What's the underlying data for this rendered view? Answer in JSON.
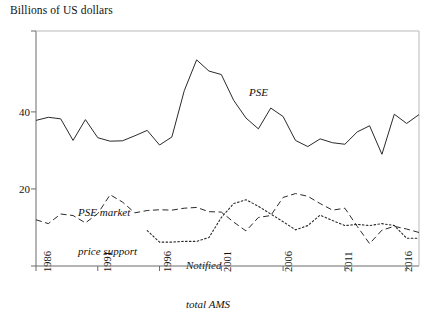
{
  "chart_data": {
    "type": "line",
    "title": "Billions of US dollars",
    "xlabel": "",
    "ylabel": "Billions of US dollars",
    "ylim": [
      0,
      61
    ],
    "xlim": [
      1986,
      2017
    ],
    "grid": false,
    "legend_position": "inline-annotations",
    "yticks": [
      20,
      40
    ],
    "ytick_labels": [
      "20",
      "40"
    ],
    "xticks": [
      1986,
      1991,
      1996,
      2001,
      2006,
      2011,
      2016
    ],
    "xtick_labels": [
      "1986",
      "1991",
      "1996",
      "2001",
      "2006",
      "2011",
      "2016"
    ],
    "x": [
      1986,
      1987,
      1988,
      1989,
      1990,
      1991,
      1992,
      1993,
      1994,
      1995,
      1996,
      1997,
      1998,
      1999,
      2000,
      2001,
      2002,
      2003,
      2004,
      2005,
      2006,
      2007,
      2008,
      2009,
      2010,
      2011,
      2012,
      2013,
      2014,
      2015,
      2016,
      2017
    ],
    "series": [
      {
        "name": "PSE",
        "style": "solid",
        "label": "PSE",
        "values": [
          37.8,
          38.6,
          38.2,
          32.6,
          38.0,
          33.3,
          32.4,
          32.5,
          33.8,
          35.2,
          31.4,
          33.5,
          45.5,
          53.5,
          50.6,
          49.7,
          43.0,
          38.4,
          35.6,
          41.0,
          38.8,
          32.6,
          31.0,
          33.0,
          32.0,
          31.6,
          34.8,
          36.4,
          29.0,
          39.4,
          37.0,
          39.3
        ]
      },
      {
        "name": "PSE market price support",
        "style": "dashed",
        "label": "PSE market\nprice support",
        "values": [
          12.0,
          11.0,
          13.5,
          13.1,
          11.2,
          13.6,
          18.5,
          16.6,
          13.8,
          14.4,
          14.6,
          14.5,
          15.0,
          15.2,
          14.1,
          14.0,
          11.4,
          9.1,
          12.6,
          13.1,
          17.8,
          18.8,
          18.1,
          16.2,
          14.5,
          15.0,
          10.3,
          5.8,
          9.3,
          10.3,
          9.6,
          8.7
        ]
      },
      {
        "name": "Notified total AMS",
        "style": "dotted",
        "label": "Notified\ntotal AMS",
        "values": [
          null,
          null,
          null,
          null,
          null,
          null,
          null,
          null,
          null,
          9.2,
          6.2,
          6.2,
          6.4,
          6.4,
          7.4,
          12.6,
          16.2,
          17.2,
          15.5,
          13.5,
          11.5,
          9.4,
          10.5,
          13.2,
          11.8,
          10.5,
          10.8,
          10.5,
          11.0,
          10.5,
          7.2,
          7.2
        ]
      }
    ],
    "annotations": [
      {
        "text": "PSE",
        "x": 2004,
        "y": 45.0
      },
      {
        "text": "PSE market price support",
        "x": 1990,
        "y": 23.5
      },
      {
        "text": "Notified total AMS",
        "x": 1999,
        "y": 11.0
      }
    ]
  },
  "labels": {
    "axis_title": "Billions of US dollars",
    "pse": "PSE",
    "pse_mps_line1": "PSE market",
    "pse_mps_line2": "price support",
    "ams_line1": "Notified",
    "ams_line2": "total AMS",
    "y20": "20",
    "y40": "40",
    "x1986": "1986",
    "x1991": "1991",
    "x1996": "1996",
    "x2001": "2001",
    "x2006": "2006",
    "x2011": "2011",
    "x2016": "2016"
  },
  "colors": {
    "line": "#2a2a2a",
    "axis": "#555555",
    "background": "#ffffff"
  }
}
